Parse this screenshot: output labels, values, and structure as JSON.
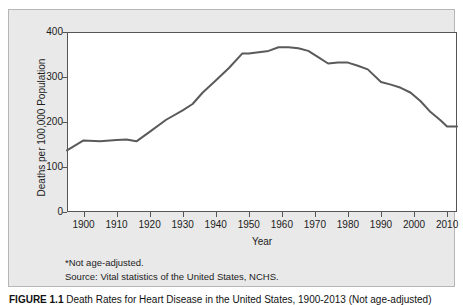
{
  "figure": {
    "panel_bg": "#e9e9e9",
    "plot_bg": "#ffffff",
    "axis_color": "#555555",
    "line_color": "#5a5a5a",
    "caption_label": "FIGURE 1.1",
    "caption_text": "Death Rates for Heart Disease in the United States, 1900-2013 (Not age-adjusted)"
  },
  "footnotes": [
    "*Not age-adjusted.",
    "Source: Vital statistics of the United States, NCHS."
  ],
  "chart_data": {
    "type": "line",
    "title": "",
    "xlabel": "Year",
    "ylabel": "Deaths per 100,000 Population",
    "xlim": [
      1895,
      2013
    ],
    "ylim": [
      0,
      400
    ],
    "grid": false,
    "legend": null,
    "xticks": [
      1900,
      1910,
      1920,
      1930,
      1940,
      1950,
      1960,
      1970,
      1980,
      1990,
      2000,
      2010
    ],
    "yticks": [
      0,
      100,
      200,
      300,
      400
    ],
    "series": [
      {
        "name": "Heart disease death rate",
        "color": "#5a5a5a",
        "x": [
          1895,
          1900,
          1905,
          1910,
          1913,
          1916,
          1920,
          1925,
          1930,
          1933,
          1936,
          1940,
          1944,
          1948,
          1950,
          1953,
          1956,
          1959,
          1962,
          1965,
          1968,
          1971,
          1974,
          1977,
          1980,
          1983,
          1986,
          1990,
          1993,
          1996,
          1999,
          2002,
          2005,
          2008,
          2010,
          2013
        ],
        "y": [
          137,
          159,
          157,
          160,
          161,
          157,
          178,
          205,
          226,
          240,
          265,
          292,
          320,
          352,
          352,
          355,
          358,
          366,
          366,
          364,
          358,
          344,
          330,
          332,
          332,
          325,
          317,
          289,
          283,
          276,
          265,
          246,
          222,
          204,
          190,
          190
        ]
      }
    ]
  }
}
